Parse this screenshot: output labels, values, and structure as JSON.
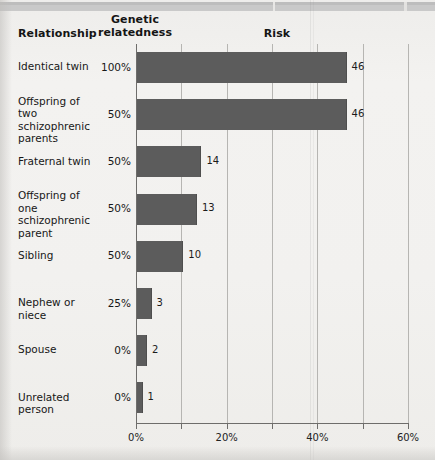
{
  "headers": {
    "relationship": "Relationship",
    "genetic_line1": "Genetic",
    "genetic_line2": "relatedness",
    "risk": "Risk"
  },
  "colors": {
    "bar": "#5c5c5c",
    "page": "#f1f0ee",
    "grid": "#b6b5b2",
    "axis": "#6e6d6b"
  },
  "chart_data": {
    "type": "bar",
    "orientation": "horizontal",
    "title": "Risk",
    "xlabel": "",
    "ylabel": "Relationship",
    "xlim": [
      0,
      60
    ],
    "xticks": [
      0,
      20,
      40,
      60
    ],
    "xtick_labels": [
      "0%",
      "20%",
      "40%",
      "60%"
    ],
    "minor_xticks": [
      10,
      30,
      50
    ],
    "gridlines": [
      0,
      10,
      20,
      30,
      40,
      50,
      60
    ],
    "grid": true,
    "legend": "none",
    "value_suffix": "",
    "categories": [
      "Identical twin",
      "Offspring of two schizophrenic parents",
      "Fraternal twin",
      "Offspring of one schizophrenic parent",
      "Sibling",
      "Nephew or niece",
      "Spouse",
      "Unrelated person"
    ],
    "values": [
      46,
      46,
      14,
      13,
      10,
      3,
      2,
      1
    ],
    "genetic_relatedness": [
      "100%",
      "50%",
      "50%",
      "50%",
      "50%",
      "25%",
      "0%",
      "0%"
    ],
    "series": [
      {
        "name": "Risk",
        "values": [
          46,
          46,
          14,
          13,
          10,
          3,
          2,
          1
        ]
      }
    ]
  },
  "rows": [
    {
      "label": "Identical twin",
      "label_lines": [
        "Identical twin"
      ],
      "genetic": "100%",
      "value": 46,
      "value_text": "46"
    },
    {
      "label": "Offspring of two schizophrenic parents",
      "label_lines": [
        "Offspring of two",
        "schizophrenic",
        "parents"
      ],
      "genetic": "50%",
      "value": 46,
      "value_text": "46"
    },
    {
      "label": "Fraternal twin",
      "label_lines": [
        "Fraternal twin"
      ],
      "genetic": "50%",
      "value": 14,
      "value_text": "14"
    },
    {
      "label": "Offspring of one schizophrenic parent",
      "label_lines": [
        "Offspring of one",
        "schizophrenic",
        "parent"
      ],
      "genetic": "50%",
      "value": 13,
      "value_text": "13"
    },
    {
      "label": "Sibling",
      "label_lines": [
        "Sibling"
      ],
      "genetic": "50%",
      "value": 10,
      "value_text": "10"
    },
    {
      "label": "Nephew or niece",
      "label_lines": [
        "Nephew or niece"
      ],
      "genetic": "25%",
      "value": 3,
      "value_text": "3"
    },
    {
      "label": "Spouse",
      "label_lines": [
        "Spouse"
      ],
      "genetic": "0%",
      "value": 2,
      "value_text": "2"
    },
    {
      "label": "Unrelated person",
      "label_lines": [
        "Unrelated person"
      ],
      "genetic": "0%",
      "value": 1,
      "value_text": "1"
    }
  ],
  "axis": {
    "labels": [
      "0%",
      "20%",
      "40%",
      "60%"
    ],
    "values": [
      0,
      20,
      40,
      60
    ]
  }
}
